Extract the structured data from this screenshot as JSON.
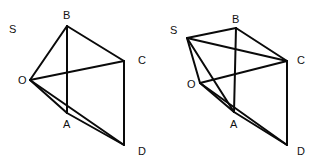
{
  "figures": [
    {
      "name": "pyramid-left",
      "point_labels": [
        "S",
        "B",
        "C",
        "O",
        "A",
        "D"
      ],
      "edges": [
        [
          "O",
          "B"
        ],
        [
          "B",
          "C"
        ],
        [
          "B",
          "A"
        ],
        [
          "O",
          "C"
        ],
        [
          "C",
          "D"
        ],
        [
          "O",
          "A"
        ],
        [
          "O",
          "D"
        ],
        [
          "A",
          "D"
        ]
      ]
    },
    {
      "name": "pyramid-right",
      "point_labels": [
        "S",
        "B",
        "C",
        "O",
        "A",
        "D"
      ],
      "edges": [
        [
          "S",
          "B"
        ],
        [
          "S",
          "C"
        ],
        [
          "S",
          "O"
        ],
        [
          "S",
          "A"
        ],
        [
          "B",
          "C"
        ],
        [
          "B",
          "A"
        ],
        [
          "O",
          "C"
        ],
        [
          "C",
          "D"
        ],
        [
          "O",
          "A"
        ],
        [
          "O",
          "D"
        ],
        [
          "A",
          "D"
        ]
      ]
    }
  ],
  "labels": {
    "left": {
      "S": "S",
      "B": "B",
      "C": "C",
      "O": "O",
      "A": "A",
      "D": "D"
    },
    "right": {
      "S": "S",
      "B": "B",
      "C": "C",
      "O": "O",
      "A": "A",
      "D": "D"
    }
  }
}
